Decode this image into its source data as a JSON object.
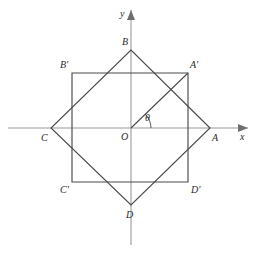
{
  "figure": {
    "width": 257,
    "height": 254,
    "background_color": "#ffffff",
    "line_color": "#4a4a4a",
    "axis_color": "#9a9a9a",
    "label_color": "#2a2a2a"
  },
  "origin": {
    "label": "O",
    "x": 131,
    "y": 128,
    "label_x": 121,
    "label_y": 140
  },
  "axes": {
    "x_axis": {
      "label": "x",
      "x1": 8,
      "y1": 128,
      "x2": 248,
      "y2": 128,
      "label_x": 240,
      "label_y": 140,
      "arrow_points": "248,128 238,124 238,132"
    },
    "y_axis": {
      "label": "y",
      "x1": 131,
      "y1": 245,
      "x2": 131,
      "y2": 10,
      "label_x": 120,
      "label_y": 17,
      "arrow_points": "131,10 127,20 135,20"
    }
  },
  "rotated_square": {
    "name": "ABCD",
    "points": "210,128 131,50 51,128 131,205",
    "vertices": [
      {
        "label": "A",
        "x": 210,
        "y": 128,
        "label_x": 212,
        "label_y": 141
      },
      {
        "label": "B",
        "x": 131,
        "y": 50,
        "label_x": 122,
        "label_y": 45
      },
      {
        "label": "C",
        "x": 51,
        "y": 128,
        "label_x": 41,
        "label_y": 141
      },
      {
        "label": "D",
        "x": 131,
        "y": 205,
        "label_x": 126,
        "label_y": 218
      }
    ]
  },
  "axis_aligned_square": {
    "name": "A'B'C'D'",
    "points": "188,73 72,73 72,182 188,182",
    "vertices": [
      {
        "label": "A'",
        "x": 188,
        "y": 73,
        "label_x": 190,
        "label_y": 68
      },
      {
        "label": "B'",
        "x": 72,
        "y": 73,
        "label_x": 60,
        "label_y": 68
      },
      {
        "label": "C'",
        "x": 72,
        "y": 182,
        "label_x": 60,
        "label_y": 193
      },
      {
        "label": "D'",
        "x": 188,
        "y": 182,
        "label_x": 191,
        "label_y": 193
      }
    ]
  },
  "radius_segment": {
    "name": "OA-prime",
    "x1": 131,
    "y1": 128,
    "x2": 188,
    "y2": 73
  },
  "angle": {
    "label": "θ",
    "symbol_name": "theta",
    "label_x": 145,
    "label_y": 121,
    "arc_path": "M 151 128 A 20 20 0 0 0 145 114",
    "vertex_x": 131,
    "vertex_y": 128
  }
}
